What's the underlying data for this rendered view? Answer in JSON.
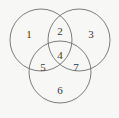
{
  "figure": {
    "type": "venn-diagram-3-set",
    "background_color": "#f7f7f5",
    "stroke_color": "#6e6e6e",
    "text_color": "#3a3a3a",
    "circles": [
      {
        "name": "top-left-circle",
        "cx": 41,
        "cy": 40,
        "r": 31
      },
      {
        "name": "top-right-circle",
        "cx": 79,
        "cy": 40,
        "r": 31
      },
      {
        "name": "bottom-circle",
        "cx": 60,
        "cy": 72,
        "r": 31
      }
    ],
    "regions": [
      {
        "id": "region-1",
        "label": "1",
        "x": 29,
        "y": 35
      },
      {
        "id": "region-2",
        "label": "2",
        "x": 60,
        "y": 32
      },
      {
        "id": "region-3",
        "label": "3",
        "x": 91,
        "y": 35
      },
      {
        "id": "region-4",
        "label": "4",
        "x": 60,
        "y": 56
      },
      {
        "id": "region-5",
        "label": "5",
        "x": 43,
        "y": 68
      },
      {
        "id": "region-6",
        "label": "6",
        "x": 60,
        "y": 91
      },
      {
        "id": "region-7",
        "label": "7",
        "x": 76,
        "y": 68
      }
    ]
  }
}
